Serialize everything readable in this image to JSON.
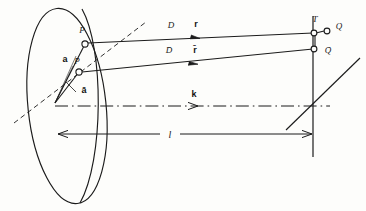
{
  "figure": {
    "background_color": "#fdfdfb",
    "ink_color": "#1b1b1b"
  },
  "aperture": {
    "name": "elliptical aperture",
    "points": [
      {
        "id": "P",
        "label": "P",
        "marker": "open-circle"
      },
      {
        "id": "Pb",
        "label": "P̄",
        "marker": "open-circle"
      }
    ],
    "vectors": [
      {
        "id": "a",
        "label": "a",
        "bold": true
      },
      {
        "id": "ab",
        "label": "ā",
        "bold": true
      }
    ]
  },
  "rays": [
    {
      "id": "upper",
      "distance_label": "D",
      "direction_label": "r"
    },
    {
      "id": "lower",
      "distance_label": "D̄",
      "direction_label": "r̄"
    }
  ],
  "axis": {
    "label": "k",
    "style": "dash-dot",
    "description": "wave vector along optical axis"
  },
  "screen": {
    "label": "T",
    "points": [
      {
        "id": "Q",
        "label": "Q",
        "marker": "open-circle"
      },
      {
        "id": "Qb",
        "label": "Q̄",
        "marker": "open-circle"
      }
    ]
  },
  "dimension": {
    "label": "l",
    "description": "distance from aperture plane to observation plane",
    "arrow": "double-headed"
  }
}
